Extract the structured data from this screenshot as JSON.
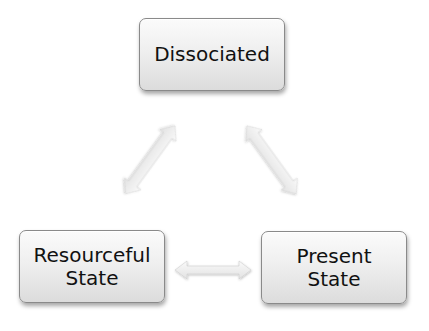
{
  "diagram": {
    "type": "triangle cycle",
    "nodes": [
      {
        "id": "dissociated",
        "lines": [
          "Dissociated"
        ]
      },
      {
        "id": "resourceful",
        "lines": [
          "Resourceful",
          "State"
        ]
      },
      {
        "id": "present",
        "lines": [
          "Present",
          "State"
        ]
      }
    ],
    "edges": [
      {
        "from": "dissociated",
        "to": "resourceful",
        "style": "double-headed arrow"
      },
      {
        "from": "dissociated",
        "to": "present",
        "style": "double-headed arrow"
      },
      {
        "from": "resourceful",
        "to": "present",
        "style": "double-headed arrow"
      }
    ],
    "colors": {
      "node_fill": "#ececec",
      "node_border": "#8a8a8a",
      "arrow_fill": "#efefef",
      "text": "#111111"
    }
  }
}
